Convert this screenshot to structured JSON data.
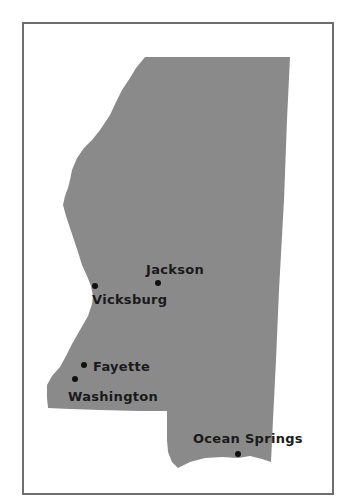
{
  "map": {
    "region": "Mississippi",
    "fill_color": "#8a8a8a",
    "border_color": "#6e6e6e",
    "background": "#ffffff"
  },
  "cities": [
    {
      "name": "Jackson",
      "dot": {
        "x": 158,
        "y": 283
      },
      "label": {
        "x": 146,
        "y": 263
      }
    },
    {
      "name": "Vicksburg",
      "dot": {
        "x": 95,
        "y": 286
      },
      "label": {
        "x": 92,
        "y": 293
      }
    },
    {
      "name": "Fayette",
      "dot": {
        "x": 84,
        "y": 365
      },
      "label": {
        "x": 93,
        "y": 360
      }
    },
    {
      "name": "Washington",
      "dot": {
        "x": 75,
        "y": 379
      },
      "label": {
        "x": 68,
        "y": 390
      }
    },
    {
      "name": "Ocean Springs",
      "dot": {
        "x": 238,
        "y": 454
      },
      "label": {
        "x": 193,
        "y": 432
      }
    }
  ]
}
